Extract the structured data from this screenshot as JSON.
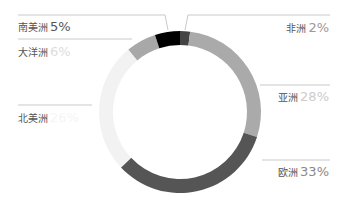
{
  "chart_data": {
    "type": "pie",
    "variant": "donut",
    "title": "",
    "categories": [
      "非洲",
      "亚洲",
      "欧洲",
      "北美洲",
      "大洋洲",
      "南美洲"
    ],
    "values": [
      2,
      28,
      33,
      26,
      6,
      5
    ],
    "colors": [
      "#444444",
      "#aaaaaa",
      "#555555",
      "#f2f2f2",
      "#a8a8a8",
      "#000000"
    ],
    "legend": "none"
  },
  "labels": [
    {
      "name": "非洲",
      "pct": "2%"
    },
    {
      "name": "亚洲",
      "pct": "28%"
    },
    {
      "name": "欧洲",
      "pct": "33%"
    },
    {
      "name": "北美洲",
      "pct": "26%"
    },
    {
      "name": "大洋洲",
      "pct": "6%"
    },
    {
      "name": "南美洲",
      "pct": "5%"
    }
  ]
}
